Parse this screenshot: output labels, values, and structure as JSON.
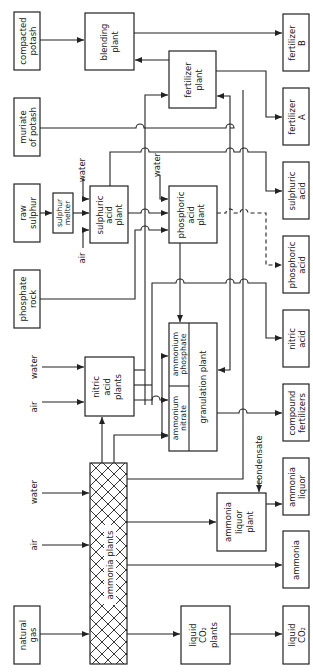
{
  "diagram": {
    "orientation": "rotated 90deg counter-clockwise; text reads bottom-to-top",
    "inputs": {
      "compacted_potash": [
        "compacted",
        "potash"
      ],
      "muriate_of_potash": [
        "muriate",
        "of potash"
      ],
      "raw_sulphur": [
        "raw",
        "sulphur"
      ],
      "phosphate_rock": [
        "phosphate",
        "rock"
      ],
      "natural_gas": [
        "natural",
        "gas"
      ],
      "water_label": "water",
      "air_label": "air"
    },
    "plants": {
      "blending": [
        "blending",
        "plant"
      ],
      "fertilizer": [
        "fertilizer",
        "plant"
      ],
      "sulphur_melter": [
        "sulphur",
        "melter"
      ],
      "sulphuric_acid": [
        "sulphuric",
        "acid",
        "plant"
      ],
      "phosphoric_acid": [
        "phosphoric",
        "acid",
        "plant"
      ],
      "nitric_acid": [
        "nitric",
        "acid",
        "plants"
      ],
      "ammonium_phosphate": [
        "ammonium",
        "phosphate"
      ],
      "ammonium_nitrate": [
        "ammonium",
        "nitrate"
      ],
      "granulation": "granulation plant",
      "ammonia_plants": "ammonia   plants",
      "ammonia_liquor": [
        "ammonia",
        "liquor",
        "plant"
      ],
      "liquid_co2": [
        "liquid",
        "CO₂",
        "plants"
      ]
    },
    "outputs": {
      "fertilizer_b": [
        "fertilizer",
        "B"
      ],
      "fertilizer_a": [
        "fertilizer",
        "A"
      ],
      "sulphuric_acid": [
        "sulphuric",
        "acid"
      ],
      "phosphoric_acid": [
        "phosphoric",
        "acid"
      ],
      "nitric_acid": [
        "nitric",
        "acid"
      ],
      "compound_fertilizers": [
        "compound",
        "fertilizers"
      ],
      "ammonia_liquor": [
        "ammonia",
        "liquor"
      ],
      "ammonia": "ammonia",
      "liquid_co2": [
        "liquid",
        "CO₂"
      ]
    },
    "flow_labels": {
      "condensate": "condensate"
    }
  }
}
